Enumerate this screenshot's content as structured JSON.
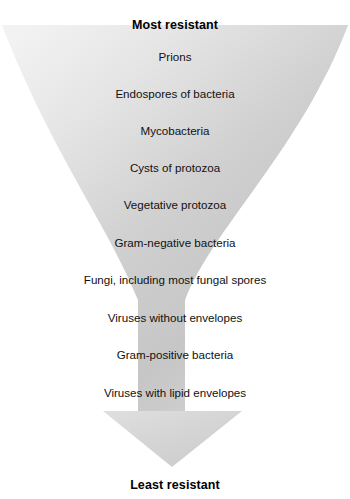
{
  "diagram": {
    "title_top": "Most resistant",
    "title_bottom": "Least resistant",
    "shape": "downward-funnel-arrow",
    "colors": {
      "background": "#ffffff",
      "fill_light": "#ededed",
      "fill_mid": "#c9c9c9",
      "fill_arrowhead": "#d6d6d6",
      "text": "#111111"
    },
    "tiers": [
      {
        "rank": 1,
        "label": "Prions",
        "top": 50
      },
      {
        "rank": 2,
        "label": "Endospores of bacteria",
        "top": 87
      },
      {
        "rank": 3,
        "label": "Mycobacteria",
        "top": 124
      },
      {
        "rank": 4,
        "label": "Cysts of protozoa",
        "top": 161
      },
      {
        "rank": 5,
        "label": "Vegetative protozoa",
        "top": 198
      },
      {
        "rank": 6,
        "label": "Gram-negative bacteria",
        "top": 236
      },
      {
        "rank": 7,
        "label": "Fungi, including most fungal spores",
        "top": 273
      },
      {
        "rank": 8,
        "label": "Viruses without envelopes",
        "top": 311
      },
      {
        "rank": 9,
        "label": "Gram-positive bacteria",
        "top": 348
      },
      {
        "rank": 10,
        "label": "Viruses with lipid envelopes",
        "top": 386
      }
    ]
  }
}
